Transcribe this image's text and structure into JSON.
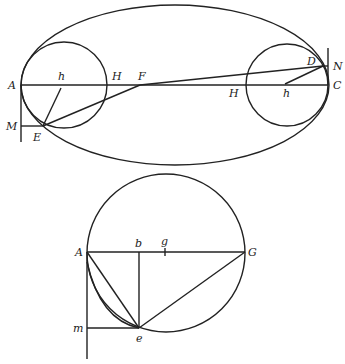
{
  "figure_top": {
    "labels": {
      "A": "A",
      "h_left": "h",
      "H_left": "H",
      "F": "F",
      "M": "M",
      "E": "E",
      "D": "D",
      "N": "N",
      "C": "C",
      "H_right": "H",
      "h_right": "h"
    }
  },
  "figure_bottom": {
    "labels": {
      "A": "A",
      "b": "b",
      "g": "g",
      "G": "G",
      "m": "m",
      "e": "e"
    }
  }
}
